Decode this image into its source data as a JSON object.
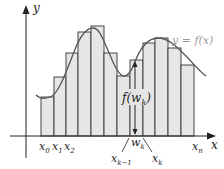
{
  "diagram": {
    "type": "riemann-sum",
    "curve_label": "y = f(x)",
    "axis_labels": {
      "x": "x",
      "y": "y"
    },
    "height_label": {
      "main": "f(w",
      "sub": "k",
      "close": ")"
    },
    "tick_labels": [
      {
        "main": "x",
        "sub": "0"
      },
      {
        "main": "x",
        "sub": "1"
      },
      {
        "main": "x",
        "sub": "2"
      },
      {
        "main": "w",
        "sub": "k"
      },
      {
        "main": "x",
        "sub": "k−1"
      },
      {
        "main": "x",
        "sub": "k"
      },
      {
        "main": "x",
        "sub": "n"
      }
    ],
    "colors": {
      "bar_fill": "#e6e6e6",
      "bar_stroke": "#333333",
      "curve": "#555555",
      "axis": "#222222",
      "curve_label": "#9a9a9a"
    },
    "bars": {
      "edges": [
        41,
        54,
        66,
        78,
        91,
        104,
        117,
        130,
        143,
        155,
        168,
        181,
        194
      ],
      "tops": [
        97,
        77,
        53,
        32,
        26,
        53,
        76,
        60,
        43,
        38,
        48,
        65
      ]
    },
    "baseline_y": 136
  }
}
